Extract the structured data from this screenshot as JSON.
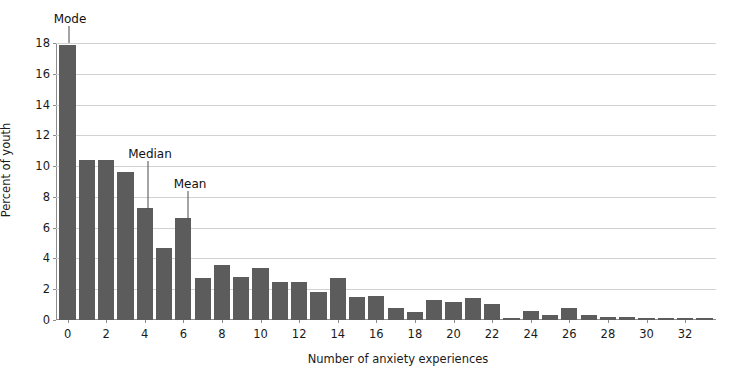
{
  "chart_data": {
    "type": "bar",
    "title": "",
    "xlabel": "Number of anxiety experiences",
    "ylabel": "Percent of youth",
    "xlim": [
      -0.6,
      33.6
    ],
    "ylim": [
      0,
      18
    ],
    "grid": true,
    "legend": null,
    "bar_color": "#5c5c5c",
    "gridline_color": "#d2d2d2",
    "axis_color": "#8c8c8c",
    "categories": [
      0,
      1,
      2,
      3,
      4,
      5,
      6,
      7,
      8,
      9,
      10,
      11,
      12,
      13,
      14,
      15,
      16,
      17,
      18,
      19,
      20,
      21,
      22,
      23,
      24,
      25,
      26,
      27,
      28,
      29,
      30,
      31,
      32,
      33
    ],
    "values": [
      17.9,
      10.4,
      10.4,
      9.6,
      7.25,
      4.65,
      6.6,
      2.7,
      3.6,
      2.8,
      3.35,
      2.5,
      2.45,
      1.85,
      2.75,
      1.5,
      1.55,
      0.8,
      0.5,
      1.3,
      1.15,
      1.45,
      1.05,
      0.15,
      0.6,
      0.35,
      0.75,
      0.3,
      0.2,
      0.2,
      0.12,
      0.12,
      0.12,
      0.12
    ],
    "xticks": [
      0,
      2,
      4,
      6,
      8,
      10,
      12,
      14,
      16,
      18,
      20,
      22,
      24,
      26,
      28,
      30,
      32
    ],
    "yticks": [
      0,
      2,
      4,
      6,
      8,
      10,
      12,
      14,
      16,
      18
    ],
    "annotations": [
      {
        "label": "Mode",
        "category": 0,
        "label_x_px": 70,
        "label_y_px": 12,
        "line_x_px": 69,
        "line_top_px": 26,
        "line_bottom_px": 43
      },
      {
        "label": "Median",
        "category": 4,
        "label_x_px": 150,
        "label_y_px": 147,
        "line_x_px": 148,
        "line_top_px": 161,
        "line_bottom_px": 209
      },
      {
        "label": "Mean",
        "category": 6,
        "label_x_px": 190,
        "label_y_px": 177,
        "line_x_px": 188,
        "line_top_px": 191,
        "line_bottom_px": 219
      }
    ]
  }
}
